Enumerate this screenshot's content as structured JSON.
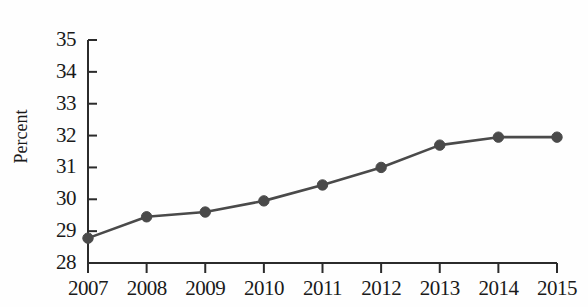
{
  "chart_data": {
    "type": "line",
    "title": "",
    "xlabel": "",
    "ylabel": "Percent",
    "categories": [
      "2007",
      "2008",
      "2009",
      "2010",
      "2011",
      "2012",
      "2013",
      "2014",
      "2015"
    ],
    "values": [
      28.78,
      29.45,
      29.6,
      29.95,
      30.45,
      31.0,
      31.7,
      31.95,
      31.95
    ],
    "series": [
      {
        "name": "Percent",
        "values": [
          28.78,
          29.45,
          29.6,
          29.95,
          30.45,
          31.0,
          31.7,
          31.95,
          31.95
        ]
      }
    ],
    "ylim": [
      28,
      35
    ],
    "ytick_labels": [
      "28",
      "29",
      "30",
      "31",
      "32",
      "33",
      "34",
      "35"
    ],
    "ytick_values": [
      28,
      29,
      30,
      31,
      32,
      33,
      34,
      35
    ],
    "xtick_labels": [
      "2007",
      "2008",
      "2009",
      "2010",
      "2011",
      "2012",
      "2013",
      "2014",
      "2015"
    ],
    "grid": false,
    "legend": false,
    "marker": "circle",
    "line_color": "#4a4a4a",
    "marker_color": "#4a4a4a",
    "axis_color": "#2b2b2b",
    "background_color": "#fefefe"
  }
}
